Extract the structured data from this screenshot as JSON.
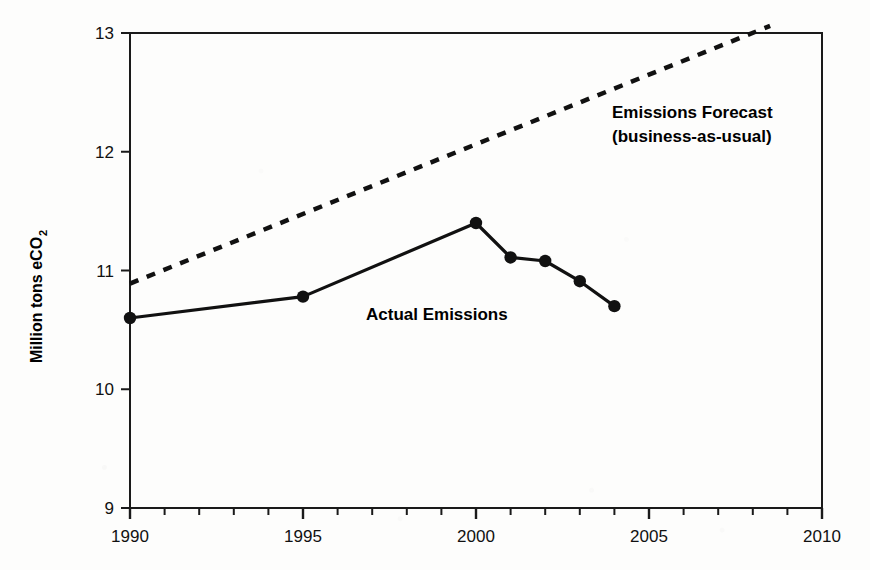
{
  "chart_data": {
    "type": "line",
    "title": "",
    "xlabel": "",
    "ylabel": "Million tons eCO2",
    "ylabel_main": "Million tons eCO",
    "ylabel_subscript": "2",
    "xlim": [
      1990,
      2010
    ],
    "ylim": [
      9,
      13
    ],
    "grid": false,
    "legend_position": "inline-annotations",
    "y_ticks": [
      "9",
      "10",
      "11",
      "12",
      "13"
    ],
    "y_tick_values": [
      9,
      10,
      11,
      12,
      13
    ],
    "x_ticks": [
      "1990",
      "1995",
      "2000",
      "2005",
      "2010"
    ],
    "x_tick_values": [
      1990,
      1995,
      2000,
      2005,
      2010
    ],
    "x_minor_tick_interval": 1,
    "series": [
      {
        "name": "Actual Emissions",
        "style": "solid",
        "markers": "filled-circle",
        "color": "#111111",
        "x": [
          1990,
          1995,
          2000,
          2001,
          2002,
          2003,
          2004
        ],
        "values": [
          10.6,
          10.78,
          11.4,
          11.11,
          11.08,
          10.91,
          10.7
        ]
      },
      {
        "name": "Emissions Forecast (business-as-usual)",
        "style": "dotted",
        "markers": "none",
        "color": "#111111",
        "x": [
          1990,
          2008.5
        ],
        "values": [
          10.89,
          13.06
        ]
      }
    ],
    "annotations": [
      {
        "id": "forecast-annotation",
        "line1": "Emissions Forecast",
        "line2": "(business-as-usual)",
        "x_px": 612,
        "y_px": 118
      },
      {
        "id": "actual-annotation",
        "line1": "Actual Emissions",
        "line2": "",
        "x_px": 366,
        "y_px": 320
      }
    ]
  },
  "axes": {
    "y_axis_name": "Million tons eCO2",
    "x_axis_name": "Year"
  }
}
